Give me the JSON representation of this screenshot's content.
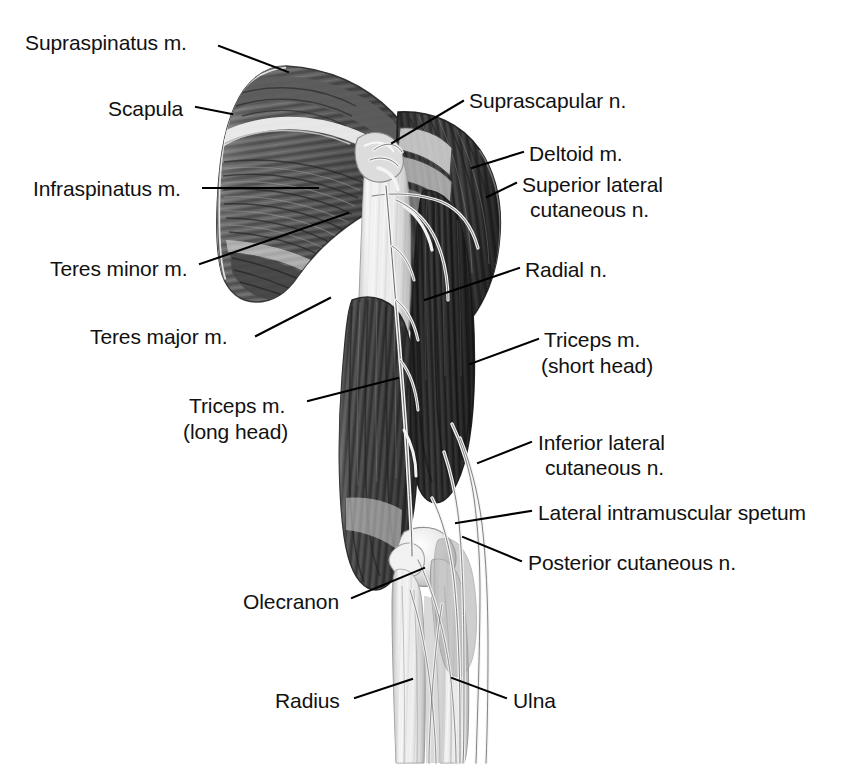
{
  "figure": {
    "view": "posterior",
    "background_color": "#ffffff",
    "ink_color": "#111111",
    "leader_line_color": "#000000"
  },
  "labels": [
    {
      "id": "supraspinatus",
      "text": "Supraspinatus m.",
      "side": "left",
      "x": 25,
      "y": 30,
      "align": "left"
    },
    {
      "id": "scapula",
      "text": "Scapula",
      "side": "left",
      "x": 108,
      "y": 96,
      "align": "left"
    },
    {
      "id": "infraspinatus",
      "text": "Infraspinatus m.",
      "side": "left",
      "x": 33,
      "y": 176,
      "align": "left"
    },
    {
      "id": "teres-minor",
      "text": "Teres minor m.",
      "side": "left",
      "x": 50,
      "y": 256,
      "align": "left"
    },
    {
      "id": "teres-major",
      "text": "Teres major m.",
      "side": "left",
      "x": 90,
      "y": 324,
      "align": "left"
    },
    {
      "id": "triceps-long-head-line1",
      "text": "Triceps m.",
      "side": "left",
      "x": 189,
      "y": 393,
      "align": "left"
    },
    {
      "id": "triceps-long-head-line2",
      "text": "(long head)",
      "side": "left",
      "x": 183,
      "y": 419,
      "align": "left"
    },
    {
      "id": "olecranon",
      "text": "Olecranon",
      "side": "left",
      "x": 243,
      "y": 589,
      "align": "left"
    },
    {
      "id": "radius",
      "text": "Radius",
      "side": "left",
      "x": 275,
      "y": 688,
      "align": "left"
    },
    {
      "id": "suprascapular",
      "text": "Suprascapular n.",
      "side": "right",
      "x": 469,
      "y": 88,
      "align": "left"
    },
    {
      "id": "deltoid",
      "text": "Deltoid m.",
      "side": "right",
      "x": 529,
      "y": 141,
      "align": "left"
    },
    {
      "id": "sup-lat-cutaneous-line1",
      "text": "Superior lateral",
      "side": "right",
      "x": 522,
      "y": 172,
      "align": "left"
    },
    {
      "id": "sup-lat-cutaneous-line2",
      "text": "cutaneous n.",
      "side": "right",
      "x": 530,
      "y": 197,
      "align": "left"
    },
    {
      "id": "radial",
      "text": "Radial n.",
      "side": "right",
      "x": 525,
      "y": 257,
      "align": "left"
    },
    {
      "id": "triceps-short-head-line1",
      "text": "Triceps m.",
      "side": "right",
      "x": 544,
      "y": 327,
      "align": "left"
    },
    {
      "id": "triceps-short-head-line2",
      "text": "(short head)",
      "side": "right",
      "x": 541,
      "y": 353,
      "align": "left"
    },
    {
      "id": "inf-lat-cutaneous-line1",
      "text": "Inferior lateral",
      "side": "right",
      "x": 538,
      "y": 430,
      "align": "left"
    },
    {
      "id": "inf-lat-cutaneous-line2",
      "text": "cutaneous n.",
      "side": "right",
      "x": 545,
      "y": 455,
      "align": "left"
    },
    {
      "id": "lateral-intramuscular",
      "text": "Lateral intramuscular spetum",
      "side": "right",
      "x": 538,
      "y": 500,
      "align": "left"
    },
    {
      "id": "posterior-cutaneous",
      "text": "Posterior cutaneous n.",
      "side": "right",
      "x": 528,
      "y": 550,
      "align": "left"
    },
    {
      "id": "ulna",
      "text": "Ulna",
      "side": "right",
      "x": 513,
      "y": 688,
      "align": "left"
    }
  ],
  "leader_lines": [
    {
      "id": "supraspinatus-leader",
      "points": "219,46 288,72"
    },
    {
      "id": "scapula-leader",
      "points": "196,107 232,114"
    },
    {
      "id": "infraspinatus-leader",
      "points": "203,188 318,188"
    },
    {
      "id": "teres-minor-leader",
      "points": "200,264 348,213"
    },
    {
      "id": "teres-major-leader",
      "points": "256,336 330,298"
    },
    {
      "id": "triceps-long-head-leader",
      "points": "308,401 398,378"
    },
    {
      "id": "olecranon-leader",
      "points": "352,598 424,568"
    },
    {
      "id": "radius-leader",
      "points": "355,698 412,679"
    },
    {
      "id": "suprascapular-leader",
      "points": "463,101 392,143"
    },
    {
      "id": "deltoid-leader",
      "points": "523,152 472,168"
    },
    {
      "id": "sup-lat-cutaneous-leader",
      "points": "516,183 487,197"
    },
    {
      "id": "radial-leader",
      "points": "519,268 425,300"
    },
    {
      "id": "triceps-short-head-leader",
      "points": "538,339 470,364"
    },
    {
      "id": "inf-lat-cutaneous-leader",
      "points": "531,442 478,463"
    },
    {
      "id": "lateral-intramuscular-leader",
      "points": "531,511 456,523"
    },
    {
      "id": "posterior-cutaneous-leader",
      "points": "521,561 463,537"
    },
    {
      "id": "ulna-leader",
      "points": "506,698 452,678"
    }
  ],
  "structures": [
    {
      "id": "scapula-mass",
      "name": "Scapula with supraspinatus, infraspinatus, teres minor and teres major muscles",
      "tone": "#6e6e6e"
    },
    {
      "id": "deltoid-mass",
      "name": "Deltoid muscle",
      "tone": "#555555"
    },
    {
      "id": "triceps-long-head",
      "name": "Triceps muscle long head",
      "tone": "#4a4a4a"
    },
    {
      "id": "triceps-short-head",
      "name": "Triceps muscle short head",
      "tone": "#3d3d3d"
    },
    {
      "id": "humerus-shaft",
      "name": "Humerus shaft",
      "tone": "#dedede"
    },
    {
      "id": "olecranon-bone",
      "name": "Olecranon process",
      "tone": "#ececec"
    },
    {
      "id": "radius-bone",
      "name": "Radius",
      "tone": "#e4e4e4"
    },
    {
      "id": "ulna-bone",
      "name": "Ulna",
      "tone": "#dcdcdc"
    },
    {
      "id": "nerve-bundle",
      "name": "Radial and cutaneous nerve branches",
      "tone": "#f2f2f2"
    }
  ]
}
